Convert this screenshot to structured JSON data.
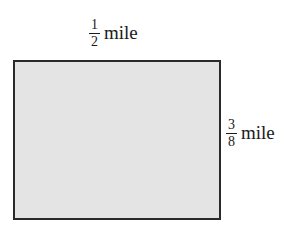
{
  "diagram": {
    "shape": "rectangle",
    "fill_color": "#e4e4e4",
    "border_color": "#2a2a2a",
    "width_label": {
      "numerator": "1",
      "denominator": "2",
      "unit": "mile"
    },
    "height_label": {
      "numerator": "3",
      "denominator": "8",
      "unit": "mile"
    }
  }
}
